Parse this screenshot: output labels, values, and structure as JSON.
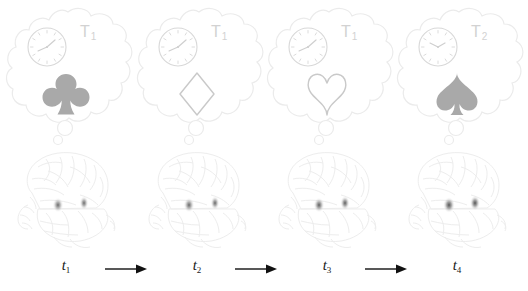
{
  "figure": {
    "background_color": "#ffffff",
    "colors": {
      "bubble_outline": "#ebebeb",
      "clock_outline": "#d8d8d8",
      "t_label": "#d2d2d2",
      "suit_filled": "#a9a9a9",
      "suit_outline": "#c9c9c9",
      "brain_outline": "#ededed",
      "activation_blob": "#6e6e6e",
      "time_label": "#1a1a1a",
      "arrow": "#111111"
    }
  },
  "panels": [
    {
      "id": "panel-1",
      "time_label": "t",
      "time_sub": "1",
      "context_label": "T",
      "context_sub": "1",
      "clock": {
        "name": "analog-clock",
        "hour_angle": 48,
        "minute_angle": 95
      },
      "suit": {
        "name": "club",
        "glyph": "♣",
        "style": "filled"
      },
      "brain": {
        "name": "brain-lateral-view",
        "activation_left": {
          "x": 48,
          "y": 60,
          "intensity": 0.74
        },
        "activation_right": {
          "x": 74,
          "y": 58,
          "intensity": 0.7
        }
      }
    },
    {
      "id": "panel-2",
      "time_label": "t",
      "time_sub": "2",
      "context_label": "T",
      "context_sub": "1",
      "clock": {
        "name": "analog-clock",
        "hour_angle": 48,
        "minute_angle": 95
      },
      "suit": {
        "name": "diamond",
        "glyph": "♦",
        "style": "outline"
      },
      "brain": {
        "name": "brain-lateral-view",
        "activation_left": {
          "x": 48,
          "y": 60,
          "intensity": 0.76
        },
        "activation_right": {
          "x": 74,
          "y": 58,
          "intensity": 0.72
        }
      }
    },
    {
      "id": "panel-3",
      "time_label": "t",
      "time_sub": "3",
      "context_label": "T",
      "context_sub": "1",
      "clock": {
        "name": "analog-clock",
        "hour_angle": 48,
        "minute_angle": 95
      },
      "suit": {
        "name": "heart",
        "glyph": "♥",
        "style": "outline"
      },
      "brain": {
        "name": "brain-lateral-view",
        "activation_left": {
          "x": 48,
          "y": 60,
          "intensity": 0.8
        },
        "activation_right": {
          "x": 74,
          "y": 58,
          "intensity": 0.78
        }
      }
    },
    {
      "id": "panel-4",
      "time_label": "t",
      "time_sub": "4",
      "context_label": "T",
      "context_sub": "2",
      "clock": {
        "name": "analog-clock",
        "hour_angle": 58,
        "minute_angle": 122
      },
      "suit": {
        "name": "spade",
        "glyph": "♠",
        "style": "filled"
      },
      "brain": {
        "name": "brain-lateral-view",
        "activation_left": {
          "x": 48,
          "y": 60,
          "intensity": 0.88
        },
        "activation_right": {
          "x": 74,
          "y": 58,
          "intensity": 0.86
        }
      }
    }
  ],
  "arrows": [
    {
      "name": "timeline-arrow-1-to-2",
      "direction": "right"
    },
    {
      "name": "timeline-arrow-2-to-3",
      "direction": "right"
    },
    {
      "name": "timeline-arrow-3-to-4",
      "direction": "right"
    }
  ]
}
